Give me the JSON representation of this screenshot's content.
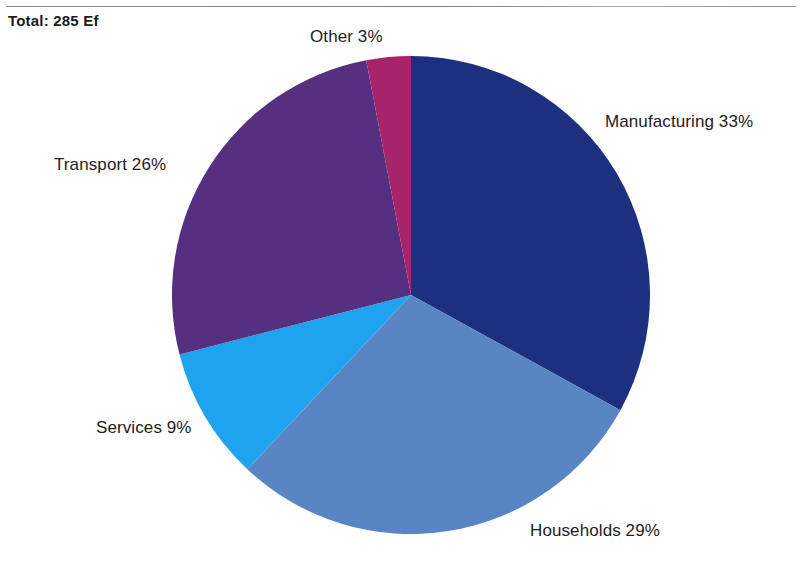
{
  "figure": {
    "total_label": "Total: 285 Ef"
  },
  "chart_data": {
    "type": "pie",
    "title": "Total: 285 Ef",
    "total_value": 285,
    "unit": "Ef",
    "start_angle_deg": 0,
    "direction": "clockwise",
    "grid": false,
    "legend_position": "none",
    "labels_position": "outside",
    "categories": [
      "Manufacturing",
      "Households",
      "Services",
      "Transport",
      "Other"
    ],
    "values": [
      33,
      29,
      9,
      26,
      3
    ],
    "value_unit": "%",
    "colors": [
      "#1d2f7f",
      "#5a85c4",
      "#1fa3ee",
      "#553080",
      "#a8246a"
    ],
    "slices": [
      {
        "name": "Manufacturing",
        "value": 33,
        "label": "Manufacturing 33%",
        "color": "#1d2f7f"
      },
      {
        "name": "Households",
        "value": 29,
        "label": "Households 29%",
        "color": "#5a85c4"
      },
      {
        "name": "Services",
        "value": 9,
        "label": "Services 9%",
        "color": "#1fa3ee"
      },
      {
        "name": "Transport",
        "value": 26,
        "label": "Transport 26%",
        "color": "#553080"
      },
      {
        "name": "Other",
        "value": 3,
        "label": "Other 3%",
        "color": "#a8246a"
      }
    ]
  }
}
